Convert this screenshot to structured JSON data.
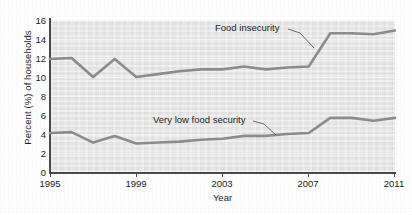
{
  "chart_data": {
    "type": "line",
    "title": "",
    "xlabel": "Year",
    "ylabel": "Percent (%) of households",
    "xlim": [
      1995,
      2011
    ],
    "ylim": [
      0,
      16
    ],
    "x": [
      1995,
      1996,
      1997,
      1998,
      1999,
      2000,
      2001,
      2002,
      2003,
      2004,
      2005,
      2006,
      2007,
      2008,
      2009,
      2010,
      2011
    ],
    "xtick_labels": [
      "1995",
      "1999",
      "2003",
      "2007",
      "2011"
    ],
    "xtick_values": [
      1995,
      1999,
      2003,
      2007,
      2011
    ],
    "ytick_labels": [
      "0",
      "2",
      "4",
      "6",
      "8",
      "10",
      "12",
      "14",
      "16"
    ],
    "ytick_values": [
      0,
      2,
      4,
      6,
      8,
      10,
      12,
      14,
      16
    ],
    "grid": true,
    "legend": "none",
    "series": [
      {
        "name": "Food insecurity",
        "color": "#8c8c8c",
        "values": [
          11.9,
          12.0,
          10.0,
          11.9,
          10.0,
          10.3,
          10.6,
          10.8,
          10.8,
          11.1,
          10.8,
          11.0,
          11.1,
          14.6,
          14.6,
          14.5,
          14.9
        ]
      },
      {
        "name": "Very low food security",
        "color": "#8c8c8c",
        "values": [
          4.1,
          4.2,
          3.1,
          3.8,
          3.0,
          3.1,
          3.2,
          3.4,
          3.5,
          3.8,
          3.8,
          4.0,
          4.1,
          5.7,
          5.7,
          5.4,
          5.7
        ]
      }
    ],
    "annotations": [
      {
        "text": "Food insecurity",
        "series": "Food insecurity"
      },
      {
        "text": "Very low food security",
        "series": "Very low food security"
      }
    ]
  },
  "colors": {
    "line": "#8c8c8c",
    "plot_background": "#e9e9e9",
    "gridline": "#f4f4f4",
    "axis": "#4a4a4a",
    "text": "#1c1c1c"
  }
}
